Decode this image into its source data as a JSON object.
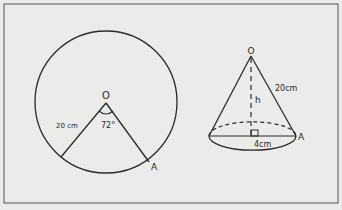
{
  "figure": {
    "left": {
      "title": "circle-with-sector",
      "center_label": "O",
      "radius_label": "20 cm",
      "angle_label": "72°",
      "point_label": "A"
    },
    "right": {
      "title": "cone",
      "apex_label": "O",
      "slant_label": "20cm",
      "height_label": "h",
      "radius_label": "4cm",
      "point_label": "A"
    }
  },
  "colors": {
    "background": "#ebebe9",
    "line": "#2a2a2a",
    "frame": "#555555"
  }
}
